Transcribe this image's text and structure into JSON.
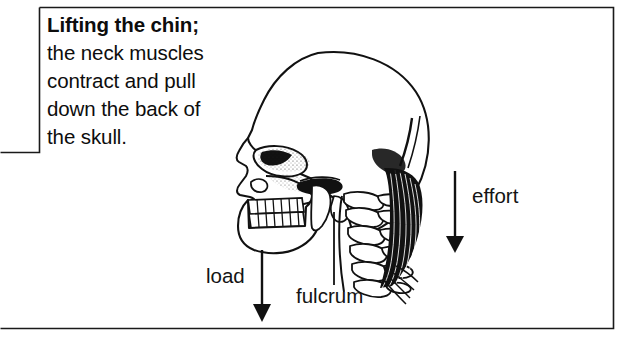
{
  "figure": {
    "kind": "anatomical-lever-diagram",
    "background_color": "#ffffff",
    "ink_color": "#111111"
  },
  "caption": {
    "lines": [
      {
        "text": "Lifting the chin;",
        "bold": true
      },
      {
        "text": "the neck muscles",
        "bold": false
      },
      {
        "text": "contract and pull",
        "bold": false
      },
      {
        "text": "down the back of",
        "bold": false
      },
      {
        "text": "the skull.",
        "bold": false
      }
    ],
    "line_0": "Lifting the chin;",
    "line_1": "the neck muscles",
    "line_2": "contract and pull",
    "line_3": "down the back of",
    "line_4": "the skull."
  },
  "annotations": {
    "effort": {
      "label": "effort",
      "arrow": "down-arrow-icon",
      "arrow_direction": "down"
    },
    "load": {
      "label": "load",
      "arrow": "down-arrow-icon",
      "arrow_direction": "down"
    },
    "fulcrum": {
      "label": "fulcrum",
      "arrow": "pointer-line",
      "arrow_direction": "up"
    }
  },
  "illustration_parts": {
    "cranium": "cranium",
    "facial_bones": "facial-bones",
    "orbit": "eye-socket",
    "nasal_aperture": "nasal-aperture",
    "maxilla_teeth": "upper-teeth",
    "mandible_teeth": "lower-teeth",
    "mandible": "mandible",
    "zygomatic_arch": "zygomatic-arch",
    "cervical_vertebrae": "cervical-vertebrae",
    "neck_muscles": "neck-muscles"
  }
}
